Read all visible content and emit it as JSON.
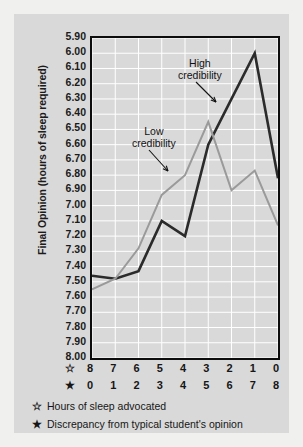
{
  "chart_data": {
    "type": "line",
    "title": "",
    "xlabel": "",
    "ylabel": "Final Opinion (hours of sleep required)",
    "ylim": [
      5.9,
      8.0
    ],
    "y_inverted": true,
    "grid": true,
    "legend_position": "inline-annotations",
    "yticks": [
      "5.90",
      "6.00",
      "6.10",
      "6.20",
      "6.30",
      "6.40",
      "6.50",
      "6.60",
      "6.70",
      "6.80",
      "6.90",
      "7.00",
      "7.10",
      "7.20",
      "7.30",
      "7.40",
      "7.50",
      "7.60",
      "7.70",
      "7.80",
      "7.90",
      "8.00"
    ],
    "x_axis_rows": [
      {
        "symbol": "☆",
        "name": "hours-of-sleep-advocated",
        "values": [
          "8",
          "7",
          "6",
          "5",
          "4",
          "3",
          "2",
          "1",
          "0"
        ]
      },
      {
        "symbol": "★",
        "name": "discrepancy",
        "values": [
          "0",
          "1",
          "2",
          "3",
          "4",
          "5",
          "6",
          "7",
          "8"
        ]
      }
    ],
    "categories": [
      0,
      1,
      2,
      3,
      4,
      5,
      6,
      7,
      8
    ],
    "series": [
      {
        "name": "High credibility",
        "color": "#2b2b2b",
        "values": [
          7.46,
          7.48,
          7.43,
          7.1,
          7.2,
          6.6,
          6.3,
          6.0,
          6.82
        ]
      },
      {
        "name": "Low credibility",
        "color": "#9a9a9a",
        "values": [
          7.55,
          7.48,
          7.28,
          6.93,
          6.8,
          6.45,
          6.9,
          6.77,
          7.13
        ]
      }
    ],
    "annotations": [
      {
        "name": "high-credibility",
        "line1": "High",
        "line2": "credibility"
      },
      {
        "name": "low-credibility",
        "line1": "Low",
        "line2": "credibility"
      }
    ]
  },
  "footnotes": [
    {
      "symbol": "☆",
      "text": "Hours of sleep advocated"
    },
    {
      "symbol": "★",
      "text": "Discrepancy from typical student's opinion"
    }
  ],
  "colors": {
    "page_background": "#f0f0ee",
    "card_background": "#d9d9d9",
    "grid": "#ffffff",
    "axis": "#0d0d0d",
    "high_credibility": "#2b2b2b",
    "low_credibility": "#9a9a9a",
    "text": "#161616"
  }
}
